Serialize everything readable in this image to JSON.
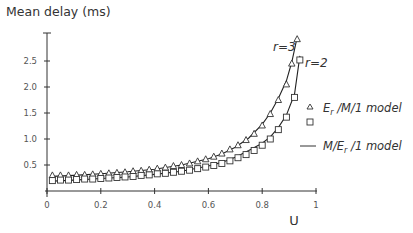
{
  "chart_data": {
    "type": "line",
    "title": "Mean delay (ms)",
    "xlabel": "U",
    "ylabel": "Mean delay (ms)",
    "xlim": [
      0,
      1
    ],
    "ylim": [
      0,
      3
    ],
    "xticks": [
      "0",
      "0.2",
      "0.4",
      "0.6",
      "0.8",
      "1"
    ],
    "yticks": [
      "0.5",
      "1.0",
      "1.5",
      "2.0",
      "2.5"
    ],
    "grid": false,
    "legend_position": "right",
    "legend": [
      {
        "marker": "triangle",
        "label_main": "E",
        "label_sub": "r",
        "label_rest": " /M/1 model"
      },
      {
        "marker": "square",
        "label_main": "",
        "label_sub": "",
        "label_rest": ""
      },
      {
        "marker": "line",
        "label_main": "M/E",
        "label_sub": "r",
        "label_rest": " /1 model"
      }
    ],
    "annotations": [
      {
        "text": "r=3",
        "series": "r=3"
      },
      {
        "text": "r=2",
        "series": "r=2"
      }
    ],
    "series": [
      {
        "name": "E_r/M/1 model r=3 (triangles)",
        "marker": "triangle",
        "x": [
          0.02,
          0.05,
          0.08,
          0.11,
          0.14,
          0.17,
          0.2,
          0.23,
          0.26,
          0.29,
          0.32,
          0.35,
          0.38,
          0.41,
          0.44,
          0.47,
          0.5,
          0.53,
          0.56,
          0.59,
          0.62,
          0.65,
          0.68,
          0.71,
          0.74,
          0.77,
          0.8,
          0.83,
          0.86,
          0.89,
          0.91,
          0.93
        ],
        "values": [
          0.3,
          0.3,
          0.3,
          0.31,
          0.31,
          0.32,
          0.33,
          0.34,
          0.35,
          0.36,
          0.38,
          0.39,
          0.41,
          0.43,
          0.45,
          0.48,
          0.5,
          0.53,
          0.57,
          0.61,
          0.66,
          0.72,
          0.8,
          0.88,
          0.98,
          1.1,
          1.26,
          1.48,
          1.75,
          2.05,
          2.45,
          2.92
        ]
      },
      {
        "name": "E_r/M/1 model r=2 (squares)",
        "marker": "square",
        "x": [
          0.02,
          0.05,
          0.08,
          0.11,
          0.14,
          0.17,
          0.2,
          0.23,
          0.26,
          0.29,
          0.32,
          0.35,
          0.38,
          0.41,
          0.44,
          0.47,
          0.5,
          0.53,
          0.56,
          0.59,
          0.62,
          0.65,
          0.68,
          0.71,
          0.74,
          0.77,
          0.8,
          0.83,
          0.86,
          0.89,
          0.92,
          0.94
        ],
        "values": [
          0.2,
          0.21,
          0.21,
          0.22,
          0.23,
          0.23,
          0.24,
          0.25,
          0.26,
          0.27,
          0.28,
          0.3,
          0.31,
          0.33,
          0.34,
          0.36,
          0.38,
          0.4,
          0.43,
          0.46,
          0.49,
          0.53,
          0.58,
          0.64,
          0.7,
          0.78,
          0.88,
          1.0,
          1.18,
          1.42,
          1.8,
          2.52
        ]
      },
      {
        "name": "M/E_r/1 model r=3 (line)",
        "marker": "line",
        "x": [
          0.02,
          0.1,
          0.2,
          0.3,
          0.4,
          0.5,
          0.6,
          0.65,
          0.7,
          0.75,
          0.8,
          0.83,
          0.86,
          0.89,
          0.91,
          0.93
        ],
        "values": [
          0.28,
          0.3,
          0.33,
          0.37,
          0.42,
          0.5,
          0.62,
          0.71,
          0.84,
          1.02,
          1.28,
          1.5,
          1.78,
          2.12,
          2.48,
          2.96
        ]
      },
      {
        "name": "M/E_r/1 model r=2 (line)",
        "marker": "line",
        "x": [
          0.02,
          0.1,
          0.2,
          0.3,
          0.4,
          0.5,
          0.6,
          0.65,
          0.7,
          0.75,
          0.8,
          0.83,
          0.86,
          0.89,
          0.92,
          0.94
        ],
        "values": [
          0.19,
          0.21,
          0.24,
          0.27,
          0.32,
          0.38,
          0.48,
          0.55,
          0.65,
          0.78,
          0.92,
          1.04,
          1.22,
          1.46,
          1.86,
          2.6
        ]
      }
    ]
  }
}
